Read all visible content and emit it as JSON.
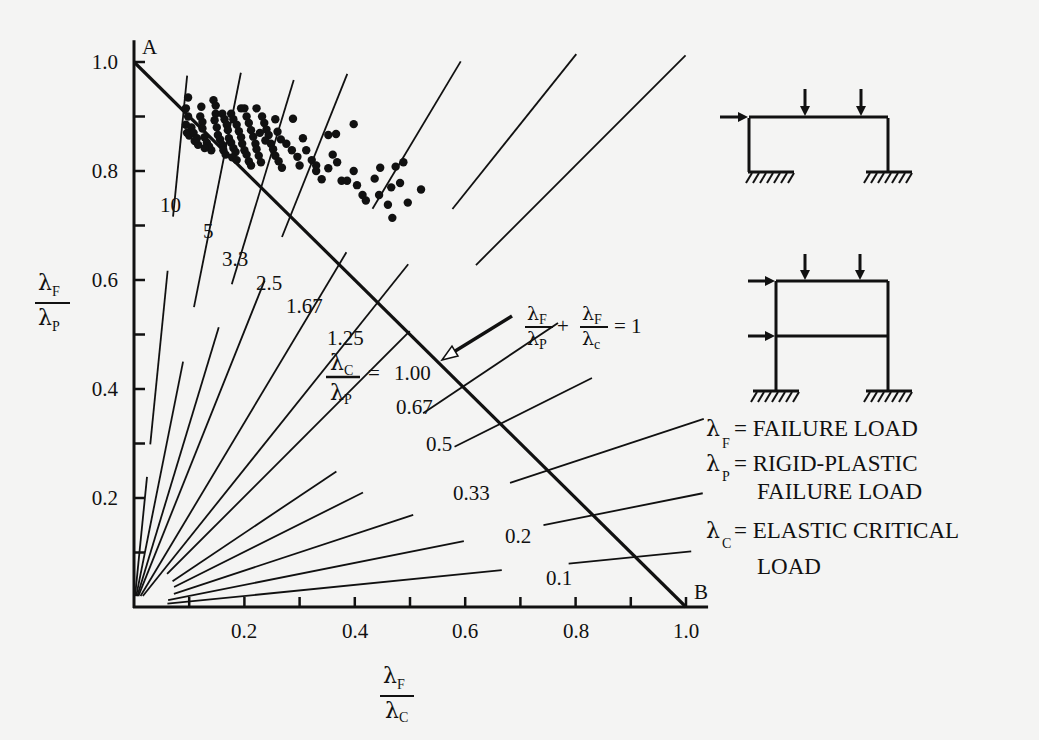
{
  "chart_data": {
    "type": "scatter",
    "title": "",
    "xlabel": "λF / λC",
    "ylabel": "λF / λP",
    "xlim": [
      0,
      1.0
    ],
    "ylim": [
      0,
      1.0
    ],
    "x_ticks": [
      0.2,
      0.4,
      0.6,
      0.8,
      1.0
    ],
    "x_tick_labels": [
      "0.2",
      "0.4",
      "0.6",
      "0.8",
      "1.0"
    ],
    "x_minor_ticks": [
      0.1,
      0.3,
      0.5,
      0.7,
      0.9
    ],
    "y_ticks": [
      0.2,
      0.4,
      0.6,
      0.8,
      1.0
    ],
    "y_tick_labels": [
      "0.2",
      "0.4",
      "0.6",
      "0.8",
      "1.0"
    ],
    "y_minor_ticks": [
      0.1,
      0.3,
      0.5,
      0.7,
      0.9
    ],
    "grid": false,
    "interaction_line": {
      "equation": "λF/λP + λF/λc = 1",
      "from_label": "A",
      "from": [
        0,
        1.0
      ],
      "to_label": "B",
      "to": [
        1.0,
        0
      ]
    },
    "radial_lines": {
      "label_prefix": "λC/λP =",
      "ratios": [
        10,
        5,
        3.3,
        2.5,
        1.67,
        1.25,
        1.0,
        0.67,
        0.5,
        0.33,
        0.2,
        0.1
      ],
      "labels": [
        "10",
        "5",
        "3.3",
        "2.5",
        "1.67",
        "1.25",
        "1.00",
        "0.67",
        "0.5",
        "0.33",
        "0.2",
        "0.1"
      ]
    },
    "series": [
      {
        "name": "test results",
        "marker": "filled-circle",
        "points": [
          [
            0.098,
            0.935
          ],
          [
            0.094,
            0.915
          ],
          [
            0.098,
            0.9
          ],
          [
            0.094,
            0.885
          ],
          [
            0.096,
            0.87
          ],
          [
            0.1,
            0.865
          ],
          [
            0.104,
            0.88
          ],
          [
            0.108,
            0.87
          ],
          [
            0.11,
            0.855
          ],
          [
            0.116,
            0.848
          ],
          [
            0.114,
            0.86
          ],
          [
            0.12,
            0.9
          ],
          [
            0.122,
            0.918
          ],
          [
            0.124,
            0.89
          ],
          [
            0.124,
            0.878
          ],
          [
            0.128,
            0.862
          ],
          [
            0.132,
            0.852
          ],
          [
            0.136,
            0.845
          ],
          [
            0.14,
            0.838
          ],
          [
            0.128,
            0.842
          ],
          [
            0.144,
            0.93
          ],
          [
            0.148,
            0.92
          ],
          [
            0.148,
            0.905
          ],
          [
            0.146,
            0.893
          ],
          [
            0.15,
            0.88
          ],
          [
            0.152,
            0.866
          ],
          [
            0.156,
            0.858
          ],
          [
            0.16,
            0.848
          ],
          [
            0.162,
            0.838
          ],
          [
            0.166,
            0.83
          ],
          [
            0.16,
            0.905
          ],
          [
            0.164,
            0.895
          ],
          [
            0.168,
            0.885
          ],
          [
            0.17,
            0.875
          ],
          [
            0.172,
            0.86
          ],
          [
            0.176,
            0.852
          ],
          [
            0.18,
            0.842
          ],
          [
            0.184,
            0.835
          ],
          [
            0.178,
            0.825
          ],
          [
            0.186,
            0.82
          ],
          [
            0.176,
            0.905
          ],
          [
            0.18,
            0.895
          ],
          [
            0.186,
            0.885
          ],
          [
            0.19,
            0.873
          ],
          [
            0.194,
            0.862
          ],
          [
            0.196,
            0.85
          ],
          [
            0.2,
            0.838
          ],
          [
            0.204,
            0.83
          ],
          [
            0.208,
            0.818
          ],
          [
            0.212,
            0.81
          ],
          [
            0.194,
            0.915
          ],
          [
            0.2,
            0.915
          ],
          [
            0.204,
            0.9
          ],
          [
            0.208,
            0.888
          ],
          [
            0.212,
            0.875
          ],
          [
            0.216,
            0.863
          ],
          [
            0.22,
            0.85
          ],
          [
            0.222,
            0.84
          ],
          [
            0.226,
            0.828
          ],
          [
            0.23,
            0.816
          ],
          [
            0.222,
            0.915
          ],
          [
            0.232,
            0.9
          ],
          [
            0.236,
            0.888
          ],
          [
            0.24,
            0.876
          ],
          [
            0.244,
            0.866
          ],
          [
            0.248,
            0.85
          ],
          [
            0.252,
            0.84
          ],
          [
            0.256,
            0.828
          ],
          [
            0.262,
            0.818
          ],
          [
            0.268,
            0.806
          ],
          [
            0.228,
            0.87
          ],
          [
            0.238,
            0.856
          ],
          [
            0.256,
            0.895
          ],
          [
            0.26,
            0.872
          ],
          [
            0.266,
            0.858
          ],
          [
            0.276,
            0.85
          ],
          [
            0.286,
            0.838
          ],
          [
            0.296,
            0.826
          ],
          [
            0.3,
            0.81
          ],
          [
            0.288,
            0.896
          ],
          [
            0.306,
            0.86
          ],
          [
            0.312,
            0.838
          ],
          [
            0.322,
            0.82
          ],
          [
            0.33,
            0.8
          ],
          [
            0.34,
            0.785
          ],
          [
            0.352,
            0.866
          ],
          [
            0.366,
            0.868
          ],
          [
            0.398,
            0.886
          ],
          [
            0.33,
            0.81
          ],
          [
            0.352,
            0.805
          ],
          [
            0.36,
            0.83
          ],
          [
            0.368,
            0.816
          ],
          [
            0.376,
            0.782
          ],
          [
            0.386,
            0.782
          ],
          [
            0.398,
            0.8
          ],
          [
            0.404,
            0.774
          ],
          [
            0.414,
            0.756
          ],
          [
            0.42,
            0.746
          ],
          [
            0.436,
            0.786
          ],
          [
            0.446,
            0.806
          ],
          [
            0.466,
            0.77
          ],
          [
            0.474,
            0.808
          ],
          [
            0.488,
            0.816
          ],
          [
            0.482,
            0.778
          ],
          [
            0.496,
            0.742
          ],
          [
            0.46,
            0.738
          ],
          [
            0.468,
            0.714
          ],
          [
            0.444,
            0.756
          ],
          [
            0.52,
            0.766
          ]
        ]
      }
    ],
    "annotations": [
      {
        "text": "λF/λP + λF/λc = 1",
        "arrow_to": [
          0.5,
          0.49
        ]
      },
      {
        "text": "A",
        "at": [
          0,
          1.0
        ]
      },
      {
        "text": "B",
        "at": [
          1.0,
          0
        ]
      }
    ],
    "legend": [
      {
        "symbol": "λ",
        "sub": "F",
        "text": "= FAILURE LOAD"
      },
      {
        "symbol": "λ",
        "sub": "P",
        "text": "= RIGID-PLASTIC FAILURE LOAD"
      },
      {
        "symbol": "λ",
        "sub": "C",
        "text": "= ELASTIC CRITICAL LOAD"
      }
    ],
    "legend_position": "right"
  },
  "labels": {
    "point_a": "A",
    "point_b": "B",
    "y_axis_num": "λ",
    "y_axis_num_sub": "F",
    "y_axis_den": "λ",
    "y_axis_den_sub": "P",
    "x_axis_num": "λ",
    "x_axis_num_sub": "F",
    "x_axis_den": "λ",
    "x_axis_den_sub": "C",
    "ratio_prefix_num": "λ",
    "ratio_prefix_num_sub": "C",
    "ratio_prefix_den": "λ",
    "ratio_prefix_den_sub": "P",
    "ratio_equals": "=",
    "formula_equals": "= 1",
    "formula_plus": "+",
    "formula_sub_p": "P",
    "formula_sub_c": "c",
    "formula_sub_f": "F"
  },
  "legend_lines": {
    "f_symbol": "λ",
    "f_sub": "F",
    "f_text": "= FAILURE LOAD",
    "p_symbol": "λ",
    "p_sub": "P",
    "p_text1": "= RIGID-PLASTIC",
    "p_text2": "FAILURE LOAD",
    "c_symbol": "λ",
    "c_sub": "C",
    "c_text1": "= ELASTIC CRITICAL",
    "c_text2": "LOAD"
  },
  "frames": [
    {
      "name": "single-storey portal frame",
      "storeys": 1
    },
    {
      "name": "two-storey frame",
      "storeys": 2
    }
  ]
}
